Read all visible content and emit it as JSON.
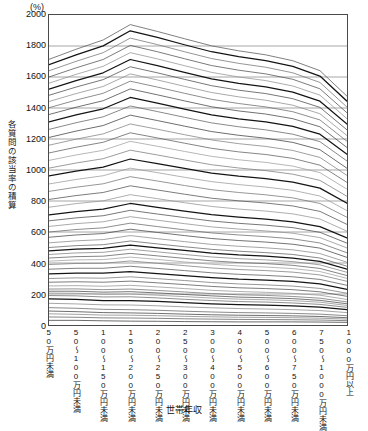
{
  "chart_data": {
    "type": "line",
    "title": "",
    "subtitle": "",
    "unit_label": "(%)",
    "xlabel": "世帯年収",
    "ylabel": "各質問の該当率の積算",
    "ylim": [
      0,
      2000
    ],
    "ytick_labels": [
      "0",
      "200",
      "400",
      "600",
      "800",
      "1000",
      "1200",
      "1400",
      "1600",
      "1800",
      "2000"
    ],
    "ytick_values": [
      0,
      200,
      400,
      600,
      800,
      1000,
      1200,
      1400,
      1600,
      1800,
      2000
    ],
    "grid": "horizontal",
    "legend": "none",
    "categories": [
      "50万円未満",
      "50〜100万円未満",
      "100〜150万円未満",
      "150〜200万円未満",
      "200〜250万円未満",
      "250〜300万円未満",
      "300〜400万円未満",
      "400〜500万円未満",
      "500〜600万円未満",
      "600〜750万円未満",
      "750〜1000万円未満",
      "1000万円以上"
    ],
    "series": [
      {
        "name": "積算線01",
        "values": [
          30,
          30,
          27,
          25,
          24,
          22,
          21,
          20,
          20,
          20,
          19,
          17
        ]
      },
      {
        "name": "積算線02",
        "values": [
          52,
          50,
          46,
          45,
          43,
          40,
          38,
          36,
          35,
          34,
          32,
          28
        ]
      },
      {
        "name": "積算線03",
        "values": [
          72,
          69,
          64,
          63,
          60,
          56,
          53,
          50,
          49,
          47,
          44,
          38
        ]
      },
      {
        "name": "積算線04",
        "values": [
          90,
          86,
          80,
          78,
          75,
          70,
          66,
          63,
          61,
          59,
          55,
          47
        ]
      },
      {
        "name": "積算線05",
        "values": [
          112,
          108,
          101,
          99,
          95,
          89,
          84,
          80,
          78,
          75,
          70,
          60
        ]
      },
      {
        "name": "積算線06",
        "values": [
          140,
          136,
          130,
          129,
          124,
          117,
          111,
          106,
          103,
          99,
          93,
          80
        ]
      },
      {
        "name": "積算線07",
        "values": [
          168,
          165,
          158,
          158,
          152,
          144,
          137,
          131,
          128,
          123,
          115,
          99
        ]
      },
      {
        "name": "積算線08",
        "values": [
          190,
          188,
          181,
          182,
          175,
          166,
          158,
          151,
          148,
          142,
          133,
          114
        ]
      },
      {
        "name": "積算線09",
        "values": [
          206,
          205,
          198,
          200,
          192,
          183,
          174,
          167,
          163,
          157,
          147,
          126
        ]
      },
      {
        "name": "積算線10",
        "values": [
          218,
          218,
          212,
          215,
          207,
          197,
          188,
          180,
          176,
          170,
          159,
          137
        ]
      },
      {
        "name": "積算線11",
        "values": [
          232,
          233,
          228,
          232,
          223,
          213,
          203,
          195,
          191,
          184,
          173,
          149
        ]
      },
      {
        "name": "積算線12",
        "values": [
          252,
          254,
          250,
          256,
          246,
          235,
          224,
          216,
          211,
          204,
          192,
          165
        ]
      },
      {
        "name": "積算線13",
        "values": [
          276,
          279,
          276,
          283,
          272,
          261,
          249,
          240,
          235,
          228,
          214,
          185
        ]
      },
      {
        "name": "積算線14",
        "values": [
          300,
          304,
          302,
          311,
          299,
          287,
          274,
          265,
          259,
          251,
          236,
          205
        ]
      },
      {
        "name": "積算線15",
        "values": [
          330,
          335,
          334,
          345,
          332,
          319,
          306,
          296,
          290,
          281,
          265,
          230
        ]
      },
      {
        "name": "積算線16",
        "values": [
          360,
          366,
          366,
          379,
          365,
          351,
          337,
          327,
          320,
          311,
          294,
          256
        ]
      },
      {
        "name": "積算線17",
        "values": [
          390,
          397,
          398,
          413,
          398,
          383,
          368,
          358,
          351,
          341,
          323,
          282
        ]
      },
      {
        "name": "積算線18",
        "values": [
          412,
          420,
          422,
          438,
          423,
          407,
          392,
          381,
          374,
          364,
          345,
          301
        ]
      },
      {
        "name": "積算線19",
        "values": [
          432,
          441,
          444,
          462,
          446,
          430,
          414,
          403,
          396,
          385,
          365,
          319
        ]
      },
      {
        "name": "積算線20",
        "values": [
          455,
          465,
          469,
          489,
          472,
          455,
          439,
          428,
          420,
          409,
          388,
          340
        ]
      },
      {
        "name": "積算線21",
        "values": [
          478,
          489,
          494,
          516,
          498,
          481,
          464,
          452,
          444,
          432,
          410,
          360
        ]
      },
      {
        "name": "積算線22",
        "values": [
          500,
          512,
          518,
          542,
          523,
          505,
          488,
          476,
          467,
          455,
          432,
          379
        ]
      },
      {
        "name": "積算線23",
        "values": [
          530,
          543,
          551,
          577,
          557,
          538,
          520,
          508,
          498,
          485,
          461,
          405
        ]
      },
      {
        "name": "積算線24",
        "values": [
          566,
          581,
          590,
          618,
          597,
          577,
          558,
          545,
          535,
          521,
          496,
          436
        ]
      },
      {
        "name": "積算線25",
        "values": [
          600,
          616,
          627,
          657,
          635,
          614,
          594,
          581,
          570,
          556,
          529,
          466
        ]
      },
      {
        "name": "積算線26",
        "values": [
          636,
          654,
          666,
          699,
          676,
          654,
          633,
          619,
          607,
          592,
          564,
          497
        ]
      },
      {
        "name": "積算線27",
        "values": [
          672,
          691,
          705,
          740,
          716,
          693,
          671,
          656,
          644,
          628,
          598,
          528
        ]
      },
      {
        "name": "積算線28",
        "values": [
          710,
          731,
          747,
          784,
          759,
          734,
          712,
          696,
          683,
          666,
          635,
          561
        ]
      },
      {
        "name": "積算線29",
        "values": [
          760,
          783,
          801,
          841,
          815,
          789,
          765,
          748,
          735,
          717,
          684,
          605
        ]
      },
      {
        "name": "積算線30",
        "values": [
          810,
          835,
          855,
          898,
          871,
          844,
          818,
          801,
          787,
          768,
          733,
          649
        ]
      },
      {
        "name": "積算線31",
        "values": [
          862,
          889,
          911,
          957,
          929,
          900,
          873,
          855,
          840,
          820,
          784,
          695
        ]
      },
      {
        "name": "積算線32",
        "values": [
          910,
          939,
          963,
          1012,
          983,
          953,
          925,
          906,
          890,
          869,
          832,
          738
        ]
      },
      {
        "name": "積算線33",
        "values": [
          962,
          993,
          1019,
          1071,
          1041,
          1010,
          980,
          960,
          944,
          922,
          883,
          785
        ]
      },
      {
        "name": "積算線34",
        "values": [
          1012,
          1045,
          1073,
          1128,
          1097,
          1065,
          1034,
          1013,
          996,
          973,
          933,
          830
        ]
      },
      {
        "name": "積算線35",
        "values": [
          1062,
          1097,
          1127,
          1185,
          1153,
          1120,
          1088,
          1066,
          1049,
          1025,
          983,
          876
        ]
      },
      {
        "name": "積算線36",
        "values": [
          1110,
          1147,
          1179,
          1240,
          1207,
          1173,
          1140,
          1117,
          1100,
          1075,
          1031,
          920
        ]
      },
      {
        "name": "積算線37",
        "values": [
          1160,
          1199,
          1233,
          1297,
          1263,
          1228,
          1194,
          1170,
          1152,
          1126,
          1081,
          965
        ]
      },
      {
        "name": "積算線38",
        "values": [
          1210,
          1251,
          1287,
          1354,
          1319,
          1283,
          1248,
          1224,
          1205,
          1178,
          1131,
          1011
        ]
      },
      {
        "name": "積算線39",
        "values": [
          1262,
          1305,
          1343,
          1413,
          1377,
          1340,
          1304,
          1279,
          1259,
          1231,
          1183,
          1058
        ]
      },
      {
        "name": "積算線40",
        "values": [
          1310,
          1355,
          1395,
          1468,
          1431,
          1393,
          1356,
          1330,
          1310,
          1281,
          1231,
          1101
        ]
      },
      {
        "name": "積算線41",
        "values": [
          1358,
          1405,
          1447,
          1523,
          1485,
          1446,
          1408,
          1381,
          1361,
          1331,
          1279,
          1145
        ]
      },
      {
        "name": "積算線42",
        "values": [
          1402,
          1451,
          1495,
          1573,
          1535,
          1495,
          1456,
          1429,
          1407,
          1376,
          1323,
          1185
        ]
      },
      {
        "name": "積算線43",
        "values": [
          1442,
          1493,
          1539,
          1620,
          1581,
          1540,
          1500,
          1472,
          1450,
          1418,
          1363,
          1222
        ]
      },
      {
        "name": "積算線44",
        "values": [
          1482,
          1535,
          1583,
          1666,
          1627,
          1585,
          1544,
          1515,
          1493,
          1460,
          1404,
          1259
        ]
      },
      {
        "name": "積算線45",
        "values": [
          1522,
          1577,
          1627,
          1713,
          1673,
          1630,
          1588,
          1559,
          1536,
          1502,
          1444,
          1296
        ]
      },
      {
        "name": "積算線46",
        "values": [
          1560,
          1617,
          1669,
          1757,
          1717,
          1673,
          1630,
          1600,
          1577,
          1542,
          1483,
          1331
        ]
      },
      {
        "name": "積算線47",
        "values": [
          1600,
          1659,
          1713,
          1804,
          1763,
          1718,
          1674,
          1644,
          1620,
          1585,
          1524,
          1369
        ]
      },
      {
        "name": "積算線48",
        "values": [
          1640,
          1701,
          1757,
          1851,
          1809,
          1763,
          1719,
          1688,
          1663,
          1627,
          1565,
          1406
        ]
      },
      {
        "name": "積算線49",
        "values": [
          1680,
          1743,
          1801,
          1898,
          1855,
          1808,
          1763,
          1731,
          1706,
          1669,
          1606,
          1444
        ]
      },
      {
        "name": "積算線50",
        "values": [
          1714,
          1779,
          1839,
          1938,
          1894,
          1847,
          1801,
          1769,
          1743,
          1705,
          1641,
          1476
        ]
      }
    ],
    "emphasis_series": [
      "積算線07",
      "積算線15",
      "積算線21",
      "積算線28",
      "積算線33",
      "積算線40",
      "積算線45",
      "積算線49"
    ]
  }
}
